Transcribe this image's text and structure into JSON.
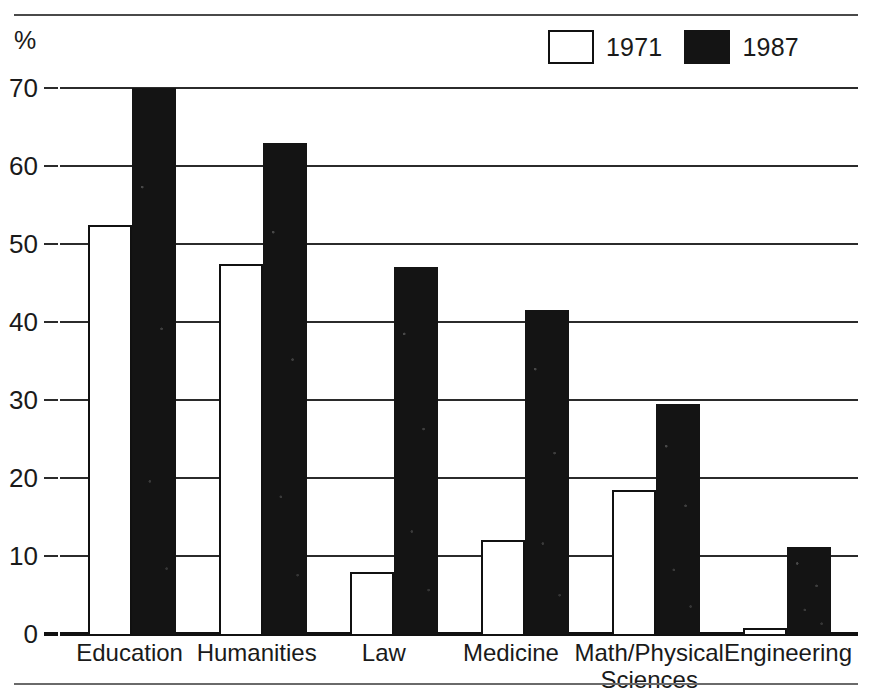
{
  "unit_label": "%",
  "legend": {
    "position": "top-right",
    "entries": [
      {
        "label": "1971",
        "swatch": "open-square",
        "color": "#ffffff"
      },
      {
        "label": "1987",
        "swatch": "filled-square",
        "color": "#141414"
      }
    ]
  },
  "axis": {
    "y_ticks": [
      "0",
      "10",
      "20",
      "30",
      "40",
      "50",
      "60",
      "70"
    ]
  },
  "chart_data": {
    "type": "bar",
    "title": "",
    "xlabel": "",
    "ylabel": "%",
    "ylim": [
      0,
      70
    ],
    "ytick_step": 10,
    "grid": true,
    "legend_position": "top-right",
    "categories": [
      "Education",
      "Humanities",
      "Law",
      "Medicine",
      "Math/Physical\nSciences",
      "Engineering"
    ],
    "series": [
      {
        "name": "1971",
        "values": [
          52.5,
          47.5,
          8.0,
          12.0,
          18.5,
          0.8
        ]
      },
      {
        "name": "1987",
        "values": [
          70.0,
          63.0,
          47.0,
          41.5,
          29.5,
          11.2
        ]
      }
    ]
  }
}
